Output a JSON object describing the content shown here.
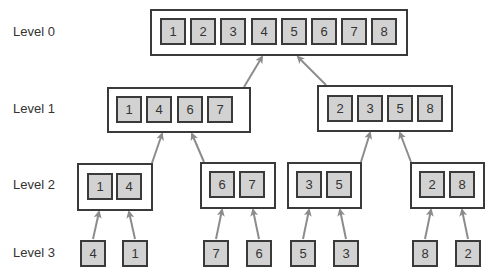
{
  "diagram": {
    "type": "merge-sort-tree",
    "colors": {
      "cell_fill": "#d2d2d2",
      "border": "#3a3a3a",
      "arrow": "#8c8c8c",
      "background": "#ffffff"
    },
    "levels": [
      {
        "label": "Level 0",
        "groups": [
          {
            "values": [
              "1",
              "2",
              "3",
              "4",
              "5",
              "6",
              "7",
              "8"
            ]
          }
        ]
      },
      {
        "label": "Level 1",
        "groups": [
          {
            "values": [
              "1",
              "4",
              "6",
              "7"
            ]
          },
          {
            "values": [
              "2",
              "3",
              "5",
              "8"
            ]
          }
        ]
      },
      {
        "label": "Level 2",
        "groups": [
          {
            "values": [
              "1",
              "4"
            ]
          },
          {
            "values": [
              "6",
              "7"
            ]
          },
          {
            "values": [
              "3",
              "5"
            ]
          },
          {
            "values": [
              "2",
              "8"
            ]
          }
        ]
      },
      {
        "label": "Level 3",
        "groups": [
          {
            "values": [
              "4"
            ]
          },
          {
            "values": [
              "1"
            ]
          },
          {
            "values": [
              "7"
            ]
          },
          {
            "values": [
              "6"
            ]
          },
          {
            "values": [
              "5"
            ]
          },
          {
            "values": [
              "3"
            ]
          },
          {
            "values": [
              "8"
            ]
          },
          {
            "values": [
              "2"
            ]
          }
        ]
      }
    ]
  }
}
